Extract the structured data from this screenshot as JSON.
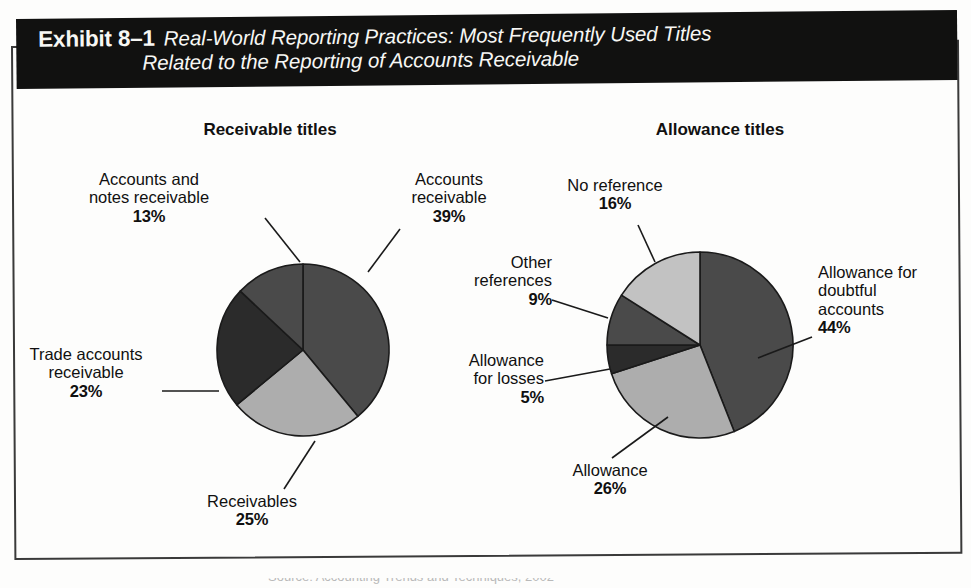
{
  "exhibit": {
    "label": "Exhibit 8–1",
    "title_line_1": "Real-World Reporting Practices: Most Frequently Used Titles",
    "title_line_2": "Related to the Reporting of Accounts Receivable"
  },
  "source": {
    "text_clipped": "Source: Accounting Trends and Techniques, 2002"
  },
  "colors": {
    "banner_background": "#111110",
    "frame_border": "#3a3a3a",
    "page_background": "#fdfdfc",
    "slice_dark_gray": "#4a4a4a",
    "slice_near_black": "#2b2b2b",
    "slice_light_gray": "#adadad",
    "slice_outline": "#1a1a1a",
    "leader_line": "#1a1a1a",
    "text": "#101010"
  },
  "chart_data": [
    {
      "type": "pie",
      "title": "Receivable titles",
      "center": [
        303,
        350
      ],
      "radius": 86,
      "start_angle_deg": 0,
      "direction": "clockwise",
      "categories": [
        "Accounts receivable",
        "Receivables",
        "Trade accounts receivable",
        "Accounts and notes receivable"
      ],
      "values": [
        39,
        25,
        23,
        13
      ],
      "unit": "%",
      "slice_colors": [
        "#4a4a4a",
        "#adadad",
        "#2b2b2b",
        "#4a4a4a"
      ],
      "labels": [
        {
          "lines": [
            "Accounts",
            "receivable"
          ],
          "pct": "39%"
        },
        {
          "lines": [
            "Receivables"
          ],
          "pct": "25%"
        },
        {
          "lines": [
            "Trade accounts",
            "receivable"
          ],
          "pct": "23%"
        },
        {
          "lines": [
            "Accounts and",
            "notes receivable"
          ],
          "pct": "13%"
        }
      ]
    },
    {
      "type": "pie",
      "title": "Allowance titles",
      "center": [
        700,
        345
      ],
      "radius": 93,
      "start_angle_deg": 0,
      "direction": "clockwise",
      "categories": [
        "Allowance for doubtful accounts",
        "Allowance",
        "Allowance for losses",
        "Other references",
        "No reference"
      ],
      "values": [
        44,
        26,
        5,
        9,
        16
      ],
      "unit": "%",
      "slice_colors": [
        "#4a4a4a",
        "#adadad",
        "#2b2b2b",
        "#4a4a4a",
        "#c2c2c2"
      ],
      "labels": [
        {
          "lines": [
            "Allowance for",
            "doubtful",
            "accounts"
          ],
          "pct": "44%"
        },
        {
          "lines": [
            "Allowance"
          ],
          "pct": "26%"
        },
        {
          "lines": [
            "Allowance",
            "for losses"
          ],
          "pct": "5%"
        },
        {
          "lines": [
            "Other",
            "references"
          ],
          "pct": "9%"
        },
        {
          "lines": [
            "No reference"
          ],
          "pct": "16%"
        }
      ]
    }
  ]
}
